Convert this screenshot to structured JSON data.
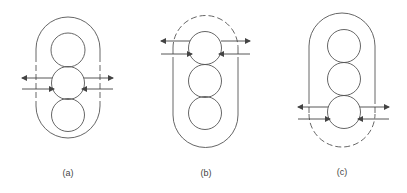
{
  "figures": [
    {
      "id": "a",
      "label": "(a)",
      "dashed_region": "sides",
      "active_circle": "middle"
    },
    {
      "id": "b",
      "label": "(b)",
      "dashed_region": "top",
      "active_circle": "top"
    },
    {
      "id": "c",
      "label": "(c)",
      "dashed_region": "bottom",
      "active_circle": "bottom"
    }
  ],
  "colors": {
    "stroke": "#555555",
    "background": "#ffffff"
  }
}
